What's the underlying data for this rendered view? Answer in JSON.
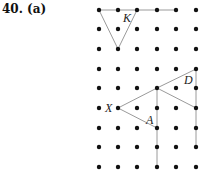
{
  "problem": {
    "number": "40.",
    "part": "(a)"
  },
  "grid": {
    "xs": [
      99,
      118,
      137,
      157,
      176,
      196
    ],
    "ys": [
      10,
      29,
      49,
      69,
      88,
      108,
      128,
      147,
      167
    ],
    "dot_radius": 2.2,
    "dot_color": "#111111"
  },
  "segments": [
    {
      "x1": 99,
      "y1": 10,
      "x2": 176,
      "y2": 10
    },
    {
      "x1": 99,
      "y1": 10,
      "x2": 118,
      "y2": 49
    },
    {
      "x1": 118,
      "y1": 49,
      "x2": 137,
      "y2": 10
    },
    {
      "x1": 157,
      "y1": 88,
      "x2": 196,
      "y2": 69
    },
    {
      "x1": 196,
      "y1": 69,
      "x2": 196,
      "y2": 147
    },
    {
      "x1": 157,
      "y1": 88,
      "x2": 196,
      "y2": 108
    },
    {
      "x1": 157,
      "y1": 88,
      "x2": 157,
      "y2": 167
    },
    {
      "x1": 118,
      "y1": 108,
      "x2": 157,
      "y2": 88
    },
    {
      "x1": 118,
      "y1": 108,
      "x2": 157,
      "y2": 128
    }
  ],
  "line_color": "#9a9a9a",
  "point_labels": [
    {
      "text": "K",
      "x": 123,
      "y": 22
    },
    {
      "text": "D",
      "x": 184,
      "y": 84
    },
    {
      "text": "X",
      "x": 105,
      "y": 112
    },
    {
      "text": "A",
      "x": 146,
      "y": 124
    }
  ]
}
